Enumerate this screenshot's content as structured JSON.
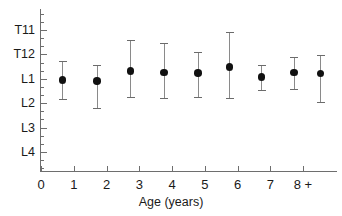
{
  "chart_data": {
    "type": "scatter",
    "title": "",
    "xlabel": "Age (years)",
    "ylabel": "",
    "x_tick_labels": [
      "0",
      "1",
      "2",
      "3",
      "4",
      "5",
      "6",
      "7",
      "8 +"
    ],
    "x_tick_values": [
      0,
      1,
      2,
      3,
      4,
      5,
      6,
      7,
      8
    ],
    "xlim": [
      0,
      9.1
    ],
    "y_tick_labels": [
      "T11",
      "T12",
      "L1",
      "L2",
      "L3",
      "L4"
    ],
    "y_levels": [
      0,
      1,
      2,
      3,
      4,
      5
    ],
    "ylim_levels": [
      -0.55,
      5.5
    ],
    "y_axis_inverted": true,
    "y_minor_ticks_per_interval": 2,
    "grid": false,
    "legend": null,
    "marker": "filled-circle",
    "error_bar_style": "capped-vertical",
    "categories": [
      "0-1",
      "1-2",
      "2-3",
      "3-4",
      "4-5",
      "5-6",
      "6-7",
      "7-8",
      "8+"
    ],
    "points": [
      {
        "x": 0.65,
        "level_label": "L1",
        "level": 2.04,
        "low_label": "T12+",
        "low": 1.28,
        "high_label": "L2-",
        "high": 2.82
      },
      {
        "x": 1.7,
        "level_label": "L1",
        "level": 2.09,
        "low_label": "T12",
        "low": 1.42,
        "high_label": "L2+",
        "high": 3.18
      },
      {
        "x": 2.72,
        "level_label": "T12/L1",
        "level": 1.66,
        "low_label": "T11",
        "low": 0.42,
        "high_label": "L2-",
        "high": 2.76
      },
      {
        "x": 3.75,
        "level_label": "T12/L1",
        "level": 1.73,
        "low_label": "T11+",
        "low": 0.55,
        "high_label": "L2-",
        "high": 2.78
      },
      {
        "x": 4.78,
        "level_label": "T12/L1",
        "level": 1.76,
        "low_label": "T12-",
        "low": 0.92,
        "high_label": "L2-",
        "high": 2.76
      },
      {
        "x": 5.75,
        "level_label": "T12/L1",
        "level": 1.5,
        "low_label": "T11-",
        "low": 0.1,
        "high_label": "L2-",
        "high": 2.8
      },
      {
        "x": 6.72,
        "level_label": "L1",
        "level": 1.92,
        "low_label": "T12+",
        "low": 1.44,
        "high_label": "L1+",
        "high": 2.44
      },
      {
        "x": 7.72,
        "level_label": "T12/L1",
        "level": 1.73,
        "low_label": "T12+",
        "low": 1.12,
        "high_label": "L1+",
        "high": 2.4
      },
      {
        "x": 8.52,
        "level_label": "T12/L1",
        "level": 1.78,
        "low_label": "T12",
        "low": 1.02,
        "high_label": "L2",
        "high": 2.96
      }
    ],
    "series": [
      {
        "name": "Conus medullaris level",
        "values": [
          2.04,
          2.09,
          1.66,
          1.73,
          1.76,
          1.5,
          1.92,
          1.73,
          1.78
        ],
        "err_low": [
          1.28,
          1.42,
          0.42,
          0.55,
          0.92,
          0.1,
          1.44,
          1.12,
          1.02
        ],
        "err_high": [
          2.82,
          3.18,
          2.76,
          2.78,
          2.76,
          2.8,
          2.44,
          2.4,
          2.96
        ]
      }
    ],
    "colors": {
      "marker": "#111111",
      "whisker": "#8a8a8a",
      "axis": "#6e6e6e",
      "text": "#1a1a1a",
      "background": "#ffffff"
    }
  }
}
